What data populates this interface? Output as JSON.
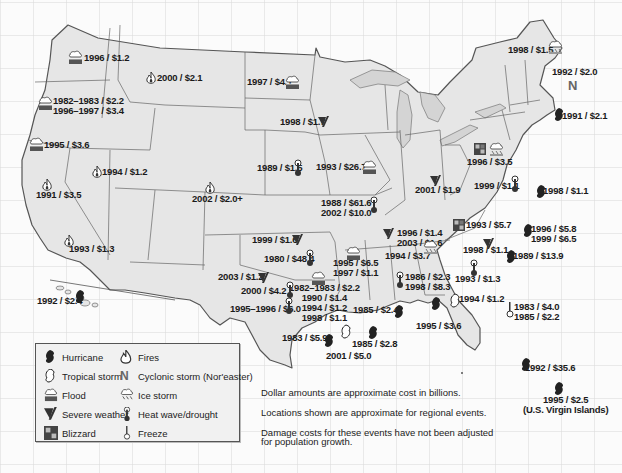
{
  "colors": {
    "background": "#fbfbfb",
    "grid": "#d8d8d8",
    "land": "#e6e6e6",
    "lake": "#d4d4d4",
    "border": "#555555",
    "text": "#1a1a1a",
    "icon": "#222222"
  },
  "legend": {
    "items": [
      {
        "icon": "hurricane-icon",
        "label": "Hurricane"
      },
      {
        "icon": "tropical-storm-icon",
        "label": "Tropical storm"
      },
      {
        "icon": "flood-icon",
        "label": "Flood"
      },
      {
        "icon": "severe-weather-icon",
        "label": "Severe weather"
      },
      {
        "icon": "blizzard-icon",
        "label": "Blizzard"
      },
      {
        "icon": "fire-icon",
        "label": "Fires"
      },
      {
        "icon": "noreaster-icon",
        "label": "Cyclonic storm (Nor'easter)"
      },
      {
        "icon": "ice-storm-icon",
        "label": "Ice storm"
      },
      {
        "icon": "heat-wave-icon",
        "label": "Heat wave/drought"
      },
      {
        "icon": "freeze-icon",
        "label": "Freeze"
      }
    ]
  },
  "notes": [
    "Dollar amounts are approximate cost in billions.",
    "Locations shown are approximate for regional events.",
    "Damage costs for these events have not been adjusted",
    "for population growth."
  ],
  "events": [
    {
      "region": "Washington",
      "type": "flood",
      "lines": [
        "1996 / $1.2"
      ]
    },
    {
      "region": "Montana/Idaho",
      "type": "fire",
      "lines": [
        "2000 / $2.1"
      ]
    },
    {
      "region": "Oregon",
      "type": "flood",
      "lines": [
        "1982–1983 / $2.2",
        "1996–1997 / $3.4"
      ]
    },
    {
      "region": "Northern California",
      "type": "flood",
      "lines": [
        "1995 / $3.6"
      ]
    },
    {
      "region": "Nevada",
      "type": "fire",
      "lines": [
        "1994 / $1.2"
      ]
    },
    {
      "region": "California (Oakland)",
      "type": "fire",
      "lines": [
        "1991 / $3.5"
      ]
    },
    {
      "region": "Southern California",
      "type": "fire",
      "lines": [
        "1993 / $1.3"
      ]
    },
    {
      "region": "Hawaii",
      "type": "hurricane",
      "lines": [
        "1992 / $2.4"
      ]
    },
    {
      "region": "North Dakota",
      "type": "flood",
      "lines": [
        "1997 / $4.1"
      ]
    },
    {
      "region": "Minnesota",
      "type": "severe-weather",
      "lines": [
        "1998 / $1.7"
      ]
    },
    {
      "region": "Colorado",
      "type": "fire",
      "lines": [
        "2002 / $2.0+"
      ]
    },
    {
      "region": "Nebraska",
      "type": "heat-wave",
      "lines": [
        "1989 / $1.5"
      ]
    },
    {
      "region": "Iowa/Midwest",
      "type": "flood",
      "lines": [
        "1993 / $26.7"
      ]
    },
    {
      "region": "Missouri",
      "type": "heat-wave",
      "lines": [
        "1988 / $61.6",
        "2002 / $10.0"
      ]
    },
    {
      "region": "Kansas",
      "type": "severe-weather",
      "lines": [
        "1999 / $1.6"
      ]
    },
    {
      "region": "Oklahoma",
      "type": "heat-wave",
      "lines": [
        "1980 / $48.4"
      ]
    },
    {
      "region": "Texas Panhandle",
      "type": "severe-weather",
      "lines": [
        "2003 / $1.2"
      ]
    },
    {
      "region": "West Texas",
      "type": "heat-wave",
      "lines": [
        "2000 / $4.2"
      ]
    },
    {
      "region": "East Texas",
      "type": "flood",
      "lines": [
        "1982–1983 / $2.2",
        "1990 / $1.4",
        "1994 / $1.2",
        "1998 / $1.1"
      ]
    },
    {
      "region": "Central Texas",
      "type": "heat-wave",
      "lines": [
        "1995–1996 / $6.0"
      ]
    },
    {
      "region": "Arkansas",
      "type": "flood",
      "lines": [
        "1995 / $6.5",
        "1997 / $1.1"
      ]
    },
    {
      "region": "Texas Gulf",
      "type": "hurricane",
      "lines": [
        "1983 / $5.9"
      ]
    },
    {
      "region": "Houston",
      "type": "tropical-storm",
      "lines": [
        "2001 / $5.0"
      ]
    },
    {
      "region": "Louisiana Gulf",
      "type": "hurricane",
      "lines": [
        "1985 / $2.8"
      ]
    },
    {
      "region": "Louisiana",
      "type": "hurricane",
      "lines": [
        "1985 / $2.4"
      ]
    },
    {
      "region": "Tennessee",
      "type": "severe-weather",
      "lines": [
        "1996 / $1.4",
        "2003 / $1.6"
      ]
    },
    {
      "region": "Mississippi",
      "type": "ice-storm",
      "lines": [
        "1994 / $3.7"
      ]
    },
    {
      "region": "Alabama",
      "type": "heat-wave",
      "lines": [
        "1986 / $2.3",
        "1998 / $8.3"
      ]
    },
    {
      "region": "Alabama Gulf",
      "type": "hurricane",
      "lines": [
        "1995 / $3.6"
      ]
    },
    {
      "region": "Florida Panhandle",
      "type": "tropical-storm",
      "lines": [
        "1994 / $1.2"
      ]
    },
    {
      "region": "Central Florida",
      "type": "freeze",
      "lines": [
        "1983 / $4.0",
        "1985 / $2.2"
      ]
    },
    {
      "region": "South Florida",
      "type": "hurricane",
      "lines": [
        "1992 / $35.6"
      ]
    },
    {
      "region": "U.S. Virgin Islands",
      "type": "hurricane",
      "lines": [
        "1995 / $2.5",
        "(U.S. Virgin Islands)"
      ]
    },
    {
      "region": "Georgia",
      "type": "heat-wave",
      "lines": [
        "1993 / $1.3"
      ]
    },
    {
      "region": "Georgia/Carolinas",
      "type": "severe-weather",
      "lines": [
        "1998 / $1.1"
      ]
    },
    {
      "region": "South Carolina",
      "type": "hurricane",
      "lines": [
        "1989 / $13.9"
      ]
    },
    {
      "region": "North Carolina",
      "type": "hurricane",
      "lines": [
        "1996 / $5.8",
        "1999 / $6.5"
      ]
    },
    {
      "region": "Virginia",
      "type": "hurricane",
      "lines": [
        "1998 / $1.1"
      ]
    },
    {
      "region": "Southeast",
      "type": "blizzard",
      "lines": [
        "1993 / $5.7"
      ]
    },
    {
      "region": "Ohio Valley",
      "type": "blizzard+flood",
      "lines": [
        "1996 / $3.5"
      ]
    },
    {
      "region": "Indiana",
      "type": "severe-weather",
      "lines": [
        "2001 / $1.9"
      ]
    },
    {
      "region": "Mid-Atlantic",
      "type": "heat-wave",
      "lines": [
        "1999 / $1.1"
      ]
    },
    {
      "region": "New England",
      "type": "ice-storm",
      "lines": [
        "1998 / $1.5"
      ]
    },
    {
      "region": "New Hampshire",
      "type": "noreaster",
      "lines": [
        "1992 / $2.0"
      ]
    },
    {
      "region": "Rhode Island",
      "type": "hurricane",
      "lines": [
        "1991 / $2.1"
      ]
    }
  ]
}
